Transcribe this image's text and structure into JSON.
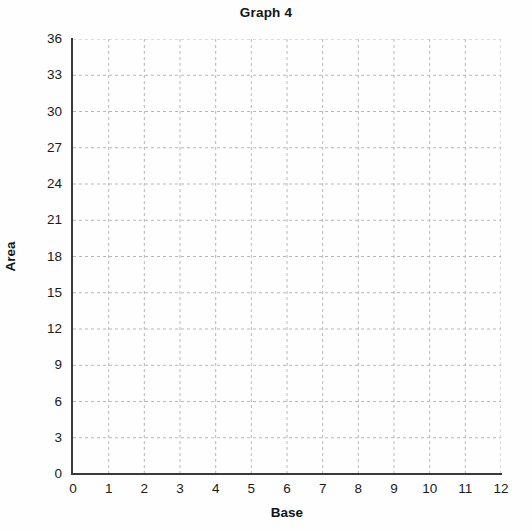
{
  "chart_data": {
    "type": "line",
    "title": "Graph 4",
    "xlabel": "Base",
    "ylabel": "Area",
    "xlim": [
      0,
      12
    ],
    "ylim": [
      0,
      36
    ],
    "xticks": [
      "0",
      "1",
      "2",
      "3",
      "4",
      "5",
      "6",
      "7",
      "8",
      "9",
      "10",
      "11",
      "12"
    ],
    "yticks": [
      "0",
      "3",
      "6",
      "9",
      "12",
      "15",
      "18",
      "21",
      "24",
      "27",
      "30",
      "33",
      "36"
    ],
    "xtick_values": [
      0,
      1,
      2,
      3,
      4,
      5,
      6,
      7,
      8,
      9,
      10,
      11,
      12
    ],
    "ytick_values": [
      0,
      3,
      6,
      9,
      12,
      15,
      18,
      21,
      24,
      27,
      30,
      33,
      36
    ],
    "grid": true,
    "grid_style": "dashed",
    "grid_color": "#b8b8b8",
    "legend": null,
    "series": [],
    "values": [],
    "categories": [],
    "annotations": [],
    "note": "Empty grid / blank graph template - no data plotted",
    "axis_color": "#3a3a3a",
    "background_color": "#ffffff",
    "text_color": "#141414"
  }
}
